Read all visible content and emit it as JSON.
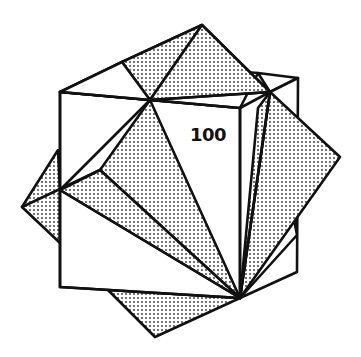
{
  "figure": {
    "label": "100",
    "colors": {
      "stroke": "#111111",
      "fill_plain": "#ffffff",
      "dot": "#333333"
    }
  }
}
